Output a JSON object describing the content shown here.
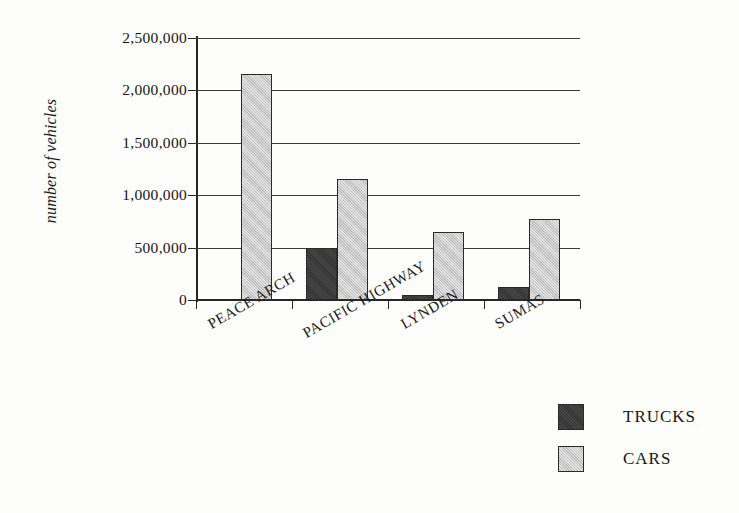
{
  "chart_data": {
    "type": "bar",
    "title": "",
    "subtitle": "",
    "xlabel": "",
    "ylabel": "number of vehicles",
    "categories": [
      "PEACE ARCH",
      "PACIFIC HIGHWAY",
      "LYNDEN",
      "SUMAS"
    ],
    "series": [
      {
        "name": "TRUCKS",
        "color": "#333333",
        "values": [
          0,
          500000,
          50000,
          120000
        ]
      },
      {
        "name": "CARS",
        "color": "#c6c6c6",
        "values": [
          2160000,
          1150000,
          650000,
          775000
        ]
      }
    ],
    "ylim": [
      0,
      2500000
    ],
    "ytick_values": [
      0,
      500000,
      1000000,
      1500000,
      2000000,
      2500000
    ],
    "ytick_labels": [
      "0",
      "500,000",
      "1,000,000",
      "1,500,000",
      "2,000,000",
      "2,500,000"
    ],
    "grid": true,
    "legend_position": "bottom-right",
    "legend_entries": [
      "TRUCKS",
      "CARS"
    ],
    "xtick_label_rotation": -30,
    "background_color": "#fdfdfb"
  }
}
